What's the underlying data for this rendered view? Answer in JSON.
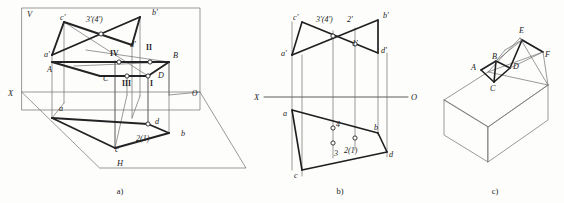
{
  "figure": {
    "background_color": "#fdfdfb",
    "line_color": "#232325",
    "thin_line_color": "#6e6e70",
    "captions": {
      "a": "a)",
      "b": "b)",
      "c": "c)"
    }
  },
  "panel_a": {
    "title": "pictorial-two-plane-projection",
    "plane_labels": {
      "v_plane": "V",
      "h_plane": "H",
      "x_axis": "X",
      "origin": "O"
    },
    "vertex_labels": [
      {
        "name": "c-prime",
        "text": "c'",
        "x": 60,
        "y": 20
      },
      {
        "name": "b-prime",
        "text": "b'",
        "x": 152,
        "y": 15
      },
      {
        "name": "a-prime",
        "text": "a'",
        "x": 44,
        "y": 57
      },
      {
        "name": "d-prime",
        "text": "d'",
        "x": 130,
        "y": 47
      },
      {
        "name": "point-A",
        "text": "A",
        "x": 47,
        "y": 72
      },
      {
        "name": "point-B",
        "text": "B",
        "x": 173,
        "y": 58
      },
      {
        "name": "point-C",
        "text": "C",
        "x": 103,
        "y": 81
      },
      {
        "name": "point-D",
        "text": "D",
        "x": 158,
        "y": 78
      },
      {
        "name": "point-a-lower",
        "text": "a",
        "x": 59,
        "y": 111
      },
      {
        "name": "point-b-lower",
        "text": "b",
        "x": 181,
        "y": 136
      },
      {
        "name": "point-c-lower",
        "text": "c",
        "x": 115,
        "y": 152
      },
      {
        "name": "point-d-lower",
        "text": "d",
        "x": 155,
        "y": 124
      }
    ],
    "intersection_labels": [
      {
        "name": "label-3prime-4prime",
        "text": "3'(4')",
        "x": 86,
        "y": 22
      },
      {
        "name": "label-roman-IV",
        "text": "IV",
        "x": 110,
        "y": 56
      },
      {
        "name": "label-roman-II",
        "text": "II",
        "x": 146,
        "y": 50
      },
      {
        "name": "label-roman-III",
        "text": "III",
        "x": 125,
        "y": 84
      },
      {
        "name": "label-roman-I",
        "text": "I",
        "x": 150,
        "y": 85
      },
      {
        "name": "label-2-1",
        "text": "2(1)",
        "x": 141,
        "y": 141
      }
    ]
  },
  "panel_b": {
    "title": "orthographic-two-view-projection",
    "axis": {
      "x_label": "X",
      "o_label": "O",
      "y": 97
    },
    "vertex_labels": [
      {
        "name": "c-prime",
        "text": "c'",
        "x": 296,
        "y": 20
      },
      {
        "name": "b-prime",
        "text": "b'",
        "x": 386,
        "y": 18
      },
      {
        "name": "a-prime",
        "text": "a'",
        "x": 286,
        "y": 55
      },
      {
        "name": "d-prime",
        "text": "d'",
        "x": 380,
        "y": 53
      },
      {
        "name": "point-a",
        "text": "a",
        "x": 285,
        "y": 115
      },
      {
        "name": "point-b",
        "text": "b",
        "x": 377,
        "y": 131
      },
      {
        "name": "point-c",
        "text": "c",
        "x": 297,
        "y": 176
      },
      {
        "name": "point-d",
        "text": "d",
        "x": 389,
        "y": 155
      }
    ],
    "intersection_labels": [
      {
        "name": "label-3prime-4prime",
        "text": "3'(4')",
        "x": 318,
        "y": 22
      },
      {
        "name": "label-2prime",
        "text": "2'",
        "x": 349,
        "y": 22
      },
      {
        "name": "label-1prime",
        "text": "1'",
        "x": 352,
        "y": 45
      },
      {
        "name": "label-4",
        "text": "4",
        "x": 338,
        "y": 127
      },
      {
        "name": "label-3",
        "text": "3",
        "x": 337,
        "y": 155
      },
      {
        "name": "label-2-1",
        "text": "2(1)",
        "x": 348,
        "y": 152
      }
    ]
  },
  "panel_c": {
    "title": "solid-model-with-notch",
    "vertex_labels": [
      {
        "name": "point-E",
        "text": "E",
        "x": 519,
        "y": 33
      },
      {
        "name": "point-B",
        "text": "B",
        "x": 490,
        "y": 60
      },
      {
        "name": "point-A",
        "text": "A",
        "x": 473,
        "y": 69
      },
      {
        "name": "point-D",
        "text": "D",
        "x": 513,
        "y": 68
      },
      {
        "name": "point-C",
        "text": "C",
        "x": 489,
        "y": 86
      },
      {
        "name": "point-F",
        "text": "F",
        "x": 545,
        "y": 58
      }
    ]
  }
}
